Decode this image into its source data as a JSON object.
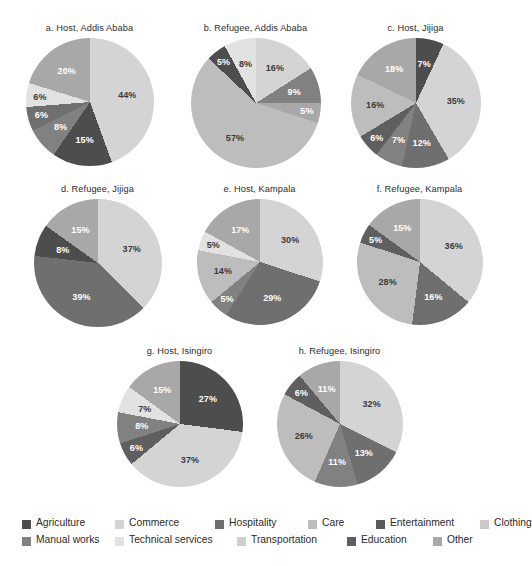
{
  "figure": {
    "title": "",
    "background": "#ffffff"
  },
  "palette": {
    "Agriculture": "#4d4d4d",
    "Commerce": "#d4d4d4",
    "Hospitality": "#6f6f6f",
    "Care": "#bdbdbd",
    "Entertainment": "#5a5a5a",
    "Clothing": "#c9c9c9",
    "Manual works": "#818181",
    "Technical services": "#e2e2e2",
    "Transportation": "#cfcfcf",
    "Education": "#5f5f5f",
    "Other": "#a8a8a8"
  },
  "legend": {
    "name": "category-legend",
    "rows": [
      [
        "Agriculture",
        "Commerce",
        "Hospitality",
        "Care",
        "Entertainment",
        "Clothing"
      ],
      [
        "Manual works",
        "Technical services",
        "Transportation",
        "Education",
        "Other"
      ]
    ]
  },
  "chart_data": [
    {
      "id": "a",
      "type": "pie",
      "title": "a. Host, Addis Ababa",
      "categories": [
        "Commerce",
        "Agriculture",
        "Manual works",
        "Hospitality",
        "Technical services",
        "Other"
      ],
      "values": [
        44,
        15,
        8,
        6,
        6,
        20
      ],
      "labels": [
        "44%",
        "15%",
        "8%",
        "6%",
        "6%",
        "20%"
      ]
    },
    {
      "id": "b",
      "type": "pie",
      "title": "b. Refugee, Addis Ababa",
      "categories": [
        "Commerce",
        "Manual works",
        "Other",
        "Care",
        "Agriculture",
        "Technical services"
      ],
      "values": [
        16,
        9,
        5,
        57,
        5,
        8
      ],
      "labels": [
        "16%",
        "9%",
        "5%",
        "57%",
        "5%",
        "8%"
      ]
    },
    {
      "id": "c",
      "type": "pie",
      "title": "c. Host, Jijiga",
      "categories": [
        "Agriculture",
        "Commerce",
        "Hospitality",
        "Manual works",
        "Education",
        "Care",
        "Other"
      ],
      "values": [
        7,
        35,
        12,
        7,
        6,
        16,
        18
      ],
      "labels": [
        "7%",
        "35%",
        "12%",
        "7%",
        "6%",
        "16%",
        "18%"
      ]
    },
    {
      "id": "d",
      "type": "pie",
      "title": "d. Refugee, Jijiga",
      "categories": [
        "Commerce",
        "Hospitality",
        "Agriculture",
        "Other"
      ],
      "values": [
        37,
        39,
        8,
        15
      ],
      "labels": [
        "37%",
        "39%",
        "8%",
        "15%"
      ]
    },
    {
      "id": "e",
      "type": "pie",
      "title": "e. Host, Kampala",
      "categories": [
        "Commerce",
        "Hospitality",
        "Manual works",
        "Care",
        "Technical services",
        "Other"
      ],
      "values": [
        30,
        29,
        5,
        14,
        5,
        17
      ],
      "labels": [
        "30%",
        "29%",
        "5%",
        "14%",
        "5%",
        "17%"
      ]
    },
    {
      "id": "f",
      "type": "pie",
      "title": "f. Refugee, Kampala",
      "categories": [
        "Commerce",
        "Hospitality",
        "Care",
        "Education",
        "Other"
      ],
      "values": [
        36,
        16,
        28,
        5,
        15
      ],
      "labels": [
        "36%",
        "16%",
        "28%",
        "5%",
        "15%"
      ]
    },
    {
      "id": "g",
      "type": "pie",
      "title": "g. Host, Isingiro",
      "categories": [
        "Agriculture",
        "Commerce",
        "Education",
        "Manual works",
        "Technical services",
        "Other"
      ],
      "values": [
        27,
        37,
        6,
        8,
        7,
        15
      ],
      "labels": [
        "27%",
        "37%",
        "6%",
        "8%",
        "7%",
        "15%"
      ]
    },
    {
      "id": "h",
      "type": "pie",
      "title": "h. Refugee, Isingiro",
      "categories": [
        "Commerce",
        "Hospitality",
        "Manual works",
        "Care",
        "Education",
        "Other"
      ],
      "values": [
        32,
        13,
        11,
        26,
        6,
        11
      ],
      "labels": [
        "32%",
        "13%",
        "11%",
        "26%",
        "6%",
        "11%"
      ]
    }
  ],
  "layout": {
    "positions": [
      {
        "id": "a",
        "left": 6,
        "top": 22,
        "size": 128,
        "labelRadius": 0.6
      },
      {
        "id": "b",
        "left": 172,
        "top": 22,
        "size": 130,
        "labelRadius": 0.62
      },
      {
        "id": "c",
        "left": 332,
        "top": 22,
        "size": 130,
        "labelRadius": 0.62
      },
      {
        "id": "d",
        "left": 14,
        "top": 183,
        "size": 128,
        "labelRadius": 0.58
      },
      {
        "id": "e",
        "left": 176,
        "top": 183,
        "size": 126,
        "labelRadius": 0.6
      },
      {
        "id": "f",
        "left": 336,
        "top": 183,
        "size": 126,
        "labelRadius": 0.6
      },
      {
        "id": "g",
        "left": 96,
        "top": 345,
        "size": 126,
        "labelRadius": 0.6
      },
      {
        "id": "h",
        "left": 256,
        "top": 345,
        "size": 126,
        "labelRadius": 0.6
      }
    ]
  }
}
